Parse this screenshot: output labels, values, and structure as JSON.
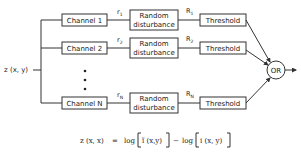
{
  "diagram": {
    "input_label": "z (x, y)",
    "channels": [
      {
        "channel_label": "Channel 1",
        "r_label": "r",
        "r_sub": "1",
        "disturbance_line1": "Random",
        "disturbance_line2": "disturbance",
        "R_label": "R",
        "R_sub": "1",
        "threshold_label": "Threshold"
      },
      {
        "channel_label": "Channel 2",
        "r_label": "r",
        "r_sub": "2",
        "disturbance_line1": "Random",
        "disturbance_line2": "disturbance",
        "R_label": "R",
        "R_sub": "2",
        "threshold_label": "Threshold"
      },
      {
        "channel_label": "Channel N",
        "r_label": "r",
        "r_sub": "N",
        "disturbance_line1": "Random",
        "disturbance_line2": "disturbance",
        "R_label": "R",
        "R_sub": "N",
        "threshold_label": "Threshold"
      }
    ],
    "ellipsis": "⋮",
    "or_label": "OR",
    "formula": {
      "lhs": "z (x, x)",
      "equals": "=",
      "log1": "log",
      "term1": "ĩ (x,y)",
      "minus": "−",
      "log2": "log",
      "term2": "i (x, y)"
    }
  }
}
